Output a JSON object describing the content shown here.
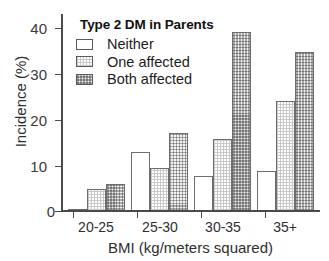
{
  "chart_data": {
    "type": "bar",
    "title": "",
    "xlabel": "BMI  (kg/meters squared)",
    "ylabel": "Incidence (%)",
    "categories": [
      "20-25",
      "25-30",
      "30-35",
      "35+"
    ],
    "series": [
      {
        "name": "Neither",
        "values": [
          0,
          13.1,
          7.9,
          9.0
        ],
        "fill": "white",
        "swatch_class": "fill-neither"
      },
      {
        "name": "One affected",
        "values": [
          5.0,
          9.7,
          16.2,
          24.6
        ],
        "fill": "light-dotted",
        "swatch_class": "fill-one"
      },
      {
        "name": "Both affected",
        "values": [
          6.0,
          17.5,
          39.9,
          35.6
        ],
        "fill": "dense-dotted",
        "swatch_class": "fill-both"
      }
    ],
    "legend_title": "Type 2 DM in Parents",
    "legend_position": "top-left-inside",
    "ylim": [
      0,
      44
    ],
    "yticks": [
      0,
      10,
      20,
      30,
      40
    ],
    "ytick_labels": [
      "0",
      "10",
      "20",
      "30",
      "40"
    ],
    "grid": false,
    "axis_color": "#4a4a4a",
    "bar_edge_color": "#6d6d6d"
  }
}
